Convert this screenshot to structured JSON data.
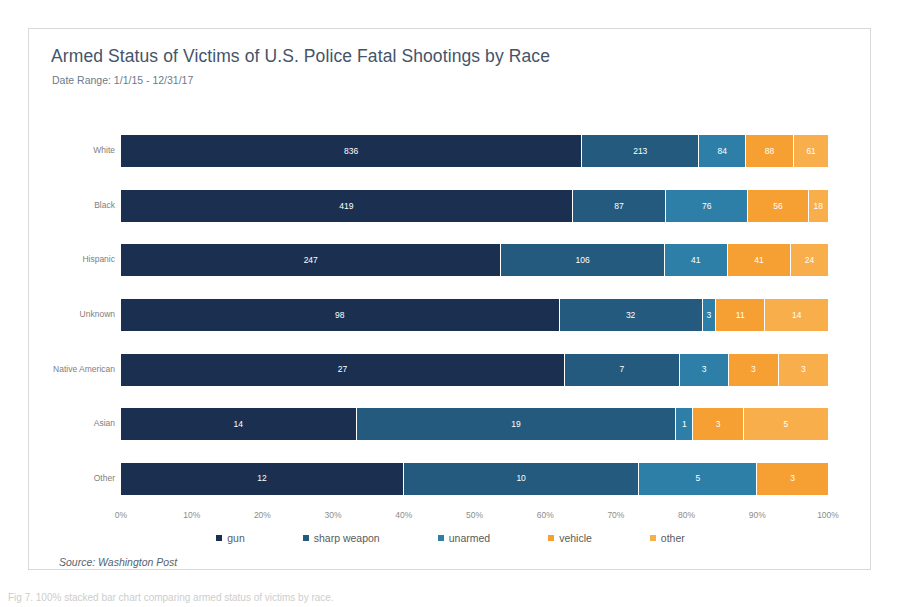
{
  "card": {
    "title": "Armed Status of Victims of U.S. Police Fatal Shootings by Race",
    "subtitle": "Date Range: 1/1/15 - 12/31/17",
    "source": "Source: Washington Post"
  },
  "caption": "Fig 7. 100% stacked bar chart comparing armed status of victims by race.",
  "colors": {
    "gun": "#1b3050",
    "sharp_weapon": "#245a7d",
    "unarmed": "#2e7fa8",
    "vehicle": "#f6a033",
    "other": "#f8ae4b",
    "card_border": "#d9d9d9",
    "title": "#44546a",
    "axis_text": "#8c8c8c"
  },
  "chart_data": {
    "type": "bar",
    "orientation": "horizontal",
    "stacked": "100%",
    "title": "Armed Status of Victims of U.S. Police Fatal Shootings by Race",
    "subtitle": "Date Range: 1/1/15 - 12/31/17",
    "xlabel": "",
    "ylabel": "",
    "xlim": [
      0,
      100
    ],
    "xticks": [
      "0%",
      "10%",
      "20%",
      "30%",
      "40%",
      "50%",
      "60%",
      "70%",
      "80%",
      "90%",
      "100%"
    ],
    "grid": false,
    "legend_position": "bottom",
    "categories": [
      "White",
      "Black",
      "Hispanic",
      "Unknown",
      "Native American",
      "Asian",
      "Other"
    ],
    "series": [
      {
        "name": "gun",
        "values": [
          836,
          419,
          247,
          98,
          27,
          14,
          12
        ]
      },
      {
        "name": "sharp weapon",
        "values": [
          213,
          87,
          106,
          32,
          7,
          19,
          10
        ]
      },
      {
        "name": "unarmed",
        "values": [
          84,
          76,
          41,
          3,
          3,
          1,
          5
        ]
      },
      {
        "name": "vehicle",
        "values": [
          88,
          56,
          41,
          11,
          3,
          3,
          3
        ]
      },
      {
        "name": "other",
        "values": [
          61,
          18,
          24,
          14,
          3,
          5,
          0
        ]
      }
    ],
    "source": "Source: Washington Post"
  }
}
